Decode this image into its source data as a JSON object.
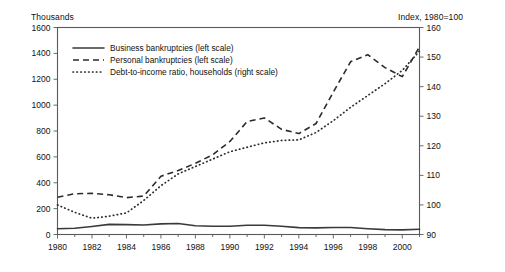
{
  "figure": {
    "left_axis_title": "Thousands",
    "right_axis_title": "Index, 1980=100"
  },
  "chart_data": {
    "type": "line",
    "title": "",
    "subtitle": "",
    "xlabel": "",
    "ylabel": "Thousands",
    "y2label": "Index, 1980=100",
    "grid": false,
    "legend_position": "top-left",
    "xlim": [
      1980,
      2001
    ],
    "ylim": [
      0,
      1600
    ],
    "y2lim": [
      90,
      160
    ],
    "x": [
      1980,
      1981,
      1982,
      1983,
      1984,
      1985,
      1986,
      1987,
      1988,
      1989,
      1990,
      1991,
      1992,
      1993,
      1994,
      1995,
      1996,
      1997,
      1998,
      1999,
      2000,
      2001
    ],
    "xticks": [
      1980,
      1982,
      1984,
      1986,
      1988,
      1990,
      1992,
      1994,
      1996,
      1998,
      2000
    ],
    "xtick_labels": [
      "1980",
      "1982",
      "1984",
      "1986",
      "1988",
      "1990",
      "1992",
      "1994",
      "1996",
      "1998",
      "2000"
    ],
    "xminor_ticks": [
      1981,
      1983,
      1985,
      1987,
      1989,
      1991,
      1993,
      1995,
      1997,
      1999,
      2001
    ],
    "yticks": [
      0,
      200,
      400,
      600,
      800,
      1000,
      1200,
      1400,
      1600
    ],
    "ytick_labels": [
      "0",
      "200",
      "400",
      "600",
      "800",
      "1000",
      "1200",
      "1400",
      "1600"
    ],
    "y2ticks": [
      90,
      100,
      110,
      120,
      130,
      140,
      150,
      160
    ],
    "y2tick_labels": [
      "90",
      "100",
      "110",
      "120",
      "130",
      "140",
      "150",
      "160"
    ],
    "series": [
      {
        "name": "Business bankruptcies (left scale)",
        "style": "solid",
        "axis": "left",
        "color": "#3a3a3a",
        "values": [
          44,
          48,
          62,
          78,
          76,
          74,
          82,
          85,
          68,
          64,
          64,
          71,
          71,
          64,
          53,
          51,
          54,
          54,
          45,
          38,
          36,
          40
        ]
      },
      {
        "name": "Personal bankruptcies (left scale)",
        "style": "dashed",
        "axis": "left",
        "color": "#2b2b2b",
        "values": [
          288,
          315,
          318,
          307,
          285,
          297,
          450,
          495,
          550,
          616,
          719,
          873,
          901,
          813,
          780,
          858,
          1100,
          1335,
          1390,
          1290,
          1220,
          1450
        ]
      },
      {
        "name": "Debt-to-income ratio, households (right scale)",
        "style": "dotted",
        "axis": "right",
        "color": "#2b2b2b",
        "values": [
          100.0,
          97.5,
          95.5,
          96.2,
          97.3,
          101.5,
          106.5,
          110.5,
          113.0,
          115.5,
          118.0,
          119.5,
          121.0,
          121.8,
          122.0,
          124.5,
          128.5,
          133.0,
          137.0,
          141.0,
          145.5,
          152.0
        ]
      }
    ],
    "legend": [
      "Business bankruptcies (left scale)",
      "Personal bankruptcies (left scale)",
      "Debt-to-income ratio, households (right scale)"
    ]
  }
}
